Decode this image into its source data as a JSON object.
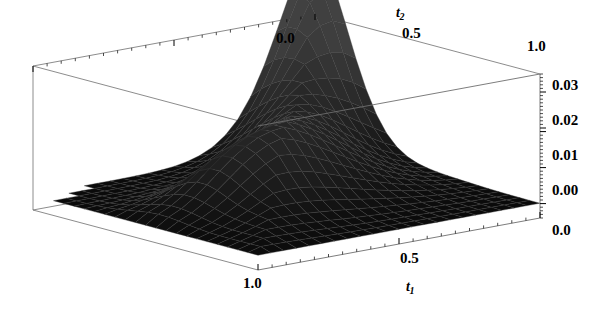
{
  "figure": {
    "type": "surface-plot-3d",
    "background_color": "#ffffff",
    "frame_color": "#6e6e6e",
    "surface_color": "#141414",
    "mesh_color": "#3a3a3a",
    "width": 602,
    "height": 309
  },
  "axes": {
    "t2_axis": {
      "name_base": "t",
      "name_sub": "2",
      "ticks": [
        "0.0",
        "0.5",
        "1.0"
      ],
      "range": [
        0.0,
        1.0
      ],
      "minor_ticks_per_interval": 4,
      "position": "top"
    },
    "t1_axis": {
      "name_base": "t",
      "name_sub": "1",
      "ticks": [
        "1.0",
        "0.5",
        "0.0"
      ],
      "range": [
        1.0,
        0.0
      ],
      "minor_ticks_per_interval": 4,
      "position": "bottom-front"
    },
    "z_axis": {
      "name_base": "",
      "name_sub": "",
      "ticks": [
        "0.00",
        "0.01",
        "0.02",
        "0.03"
      ],
      "range": [
        -0.004,
        0.035
      ],
      "minor_ticks_per_interval": 4,
      "position": "right"
    }
  },
  "chart_data": {
    "type": "surface",
    "title": "",
    "xlabel": "t1",
    "ylabel": "t2",
    "zlabel": "",
    "xlim": [
      0.0,
      1.0
    ],
    "ylim": [
      0.0,
      1.0
    ],
    "zlim": [
      0.0,
      0.035
    ],
    "grid": true,
    "legend": false,
    "xticks": [
      0.0,
      0.5,
      1.0
    ],
    "yticks": [
      0.0,
      0.5,
      1.0
    ],
    "zticks": [
      0.0,
      0.01,
      0.02,
      0.03
    ],
    "grid_nx": 22,
    "grid_ny": 22,
    "peak_value": 0.034,
    "peak_at": [
      0.0,
      1.0
    ]
  },
  "tick_labels": {
    "top": [
      {
        "text": "0.0",
        "x": 276,
        "y": 31
      },
      {
        "text": "0.5",
        "x": 402,
        "y": 26
      },
      {
        "text": "1.0",
        "x": 527,
        "y": 39
      }
    ],
    "bottom": [
      {
        "text": "1.0",
        "x": 243,
        "y": 276
      },
      {
        "text": "0.5",
        "x": 400,
        "y": 251
      }
    ],
    "right": [
      {
        "text": "0.03",
        "x": 552,
        "y": 78
      },
      {
        "text": "0.02",
        "x": 552,
        "y": 113
      },
      {
        "text": "0.01",
        "x": 552,
        "y": 148
      },
      {
        "text": "0.00",
        "x": 552,
        "y": 183
      },
      {
        "text": "0.0",
        "x": 552,
        "y": 223
      }
    ]
  },
  "axis_names": {
    "t2": {
      "x": 396,
      "y": 6
    },
    "t1": {
      "x": 406,
      "y": 280
    }
  }
}
